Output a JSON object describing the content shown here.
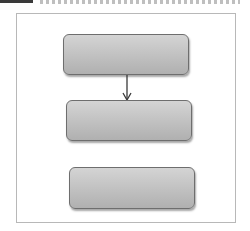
{
  "header": {
    "text": ""
  },
  "diagram": {
    "nodes": [
      {
        "id": "node-1",
        "label": ""
      },
      {
        "id": "node-2",
        "label": ""
      },
      {
        "id": "node-3",
        "label": ""
      }
    ],
    "edges": [
      {
        "from": "node-1",
        "to": "node-2",
        "style": "arrow"
      }
    ],
    "colors": {
      "node_fill": "#c4c4c4",
      "node_border": "#6e6e6e",
      "frame_border": "#b8b8b8",
      "arrow": "#3a3a3a"
    }
  }
}
